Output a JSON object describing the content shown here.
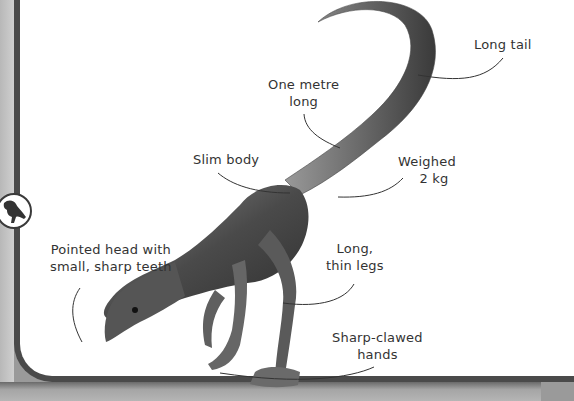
{
  "illustration": {
    "subject": "small theropod dinosaur",
    "labels": {
      "long_tail": "Long tail",
      "one_metre_long_line1": "One metre",
      "one_metre_long_line2": "long",
      "slim_body": "Slim body",
      "weighed_line1": "Weighed",
      "weighed_line2": "2 kg",
      "pointed_head_line1": "Pointed head with",
      "pointed_head_line2": "small, sharp teeth",
      "long_legs_line1": "Long,",
      "long_legs_line2": "thin legs",
      "sharp_clawed_line1": "Sharp-clawed",
      "sharp_clawed_line2": "hands"
    },
    "badge_icon": "dinosaur-silhouette-icon"
  },
  "colors": {
    "background": "#ffffff",
    "frame": "#4a4a4a",
    "text": "#333333",
    "dinosaur": "#555555"
  }
}
